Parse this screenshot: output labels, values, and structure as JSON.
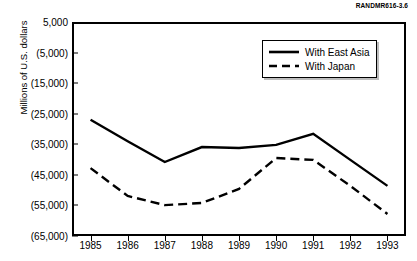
{
  "source_id": "RANDMR616-3.6",
  "chart_data": {
    "type": "line",
    "title": "",
    "xlabel": "",
    "ylabel": "Millions of U.S. dollars",
    "categories": [
      "1985",
      "1986",
      "1987",
      "1988",
      "1989",
      "1990",
      "1991",
      "1992",
      "1993"
    ],
    "ylim": [
      -65000,
      5000
    ],
    "ytick_values": [
      5000,
      -5000,
      -15000,
      -25000,
      -35000,
      -45000,
      -55000,
      -65000
    ],
    "ytick_labels": [
      "5,000",
      "(5,000)",
      "(15,000)",
      "(25,000)",
      "(35,000)",
      "(45,000)",
      "(55,000)",
      "(65,000)"
    ],
    "grid": false,
    "legend_position": "upper-right-inside",
    "series": [
      {
        "name": "With East Asia",
        "style": "solid",
        "color": "#000000",
        "values": [
          -27000,
          -34000,
          -40800,
          -35900,
          -36200,
          -35200,
          -31600,
          -40100,
          -48600
        ]
      },
      {
        "name": "With Japan",
        "style": "dashed",
        "color": "#000000",
        "values": [
          -42800,
          -51900,
          -54900,
          -54200,
          -49600,
          -39500,
          -40100,
          -48600,
          -57800
        ]
      }
    ]
  }
}
